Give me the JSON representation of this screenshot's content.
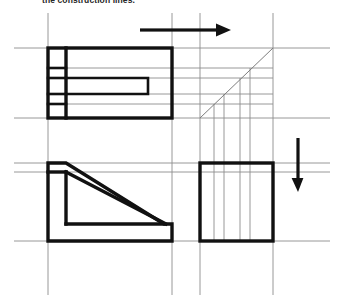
{
  "caption": {
    "text": "the construction lines."
  },
  "colors": {
    "object_line": "#111111",
    "construction_line": "#8c8c8c",
    "miter_line": "#7d7d7d",
    "arrow": "#111111",
    "background": "#ffffff",
    "caption_text": "#262626"
  },
  "drawing": {
    "type": "orthographic-projection-exercise",
    "title": "Third view projection using 45 degree miter line",
    "views": [
      {
        "name": "top-view",
        "label": "Top view",
        "shape": "rectangle-with-internal-detail",
        "x": 48,
        "y": 48,
        "width": 124,
        "height": 70,
        "internal_features": [
          {
            "name": "left-column-divider",
            "x": 66
          },
          {
            "name": "inner-slot",
            "x1": 66,
            "y1": 78,
            "x2": 148,
            "y2": 94
          }
        ]
      },
      {
        "name": "front-view",
        "label": "Front view",
        "shape": "L-shape-with-diagonal",
        "x": 48,
        "y": 163,
        "width": 124,
        "height": 78,
        "points": "48,163 66,163 66,172 164,210 164,210 164,224 66,224 66,241 172,241 172,241"
      },
      {
        "name": "side-view",
        "label": "Right side view",
        "shape": "square",
        "x": 200,
        "y": 163,
        "width": 73,
        "height": 78
      }
    ],
    "miter_line": {
      "name": "forty-five-degree-miter-line",
      "x1": 200,
      "y1": 118,
      "x2": 273,
      "y2": 48,
      "angle_degrees": 45
    },
    "arrows": [
      {
        "name": "horizontal-projection-arrow",
        "direction": "right",
        "x1": 140,
        "y1": 30,
        "x2": 228,
        "y2": 30
      },
      {
        "name": "vertical-projection-arrow",
        "direction": "down",
        "x1": 298,
        "y1": 138,
        "x2": 298,
        "y2": 190
      }
    ],
    "construction_lines": {
      "horizontal": [
        {
          "name": "h-line-top-view-top",
          "y": 48,
          "x1": 14,
          "x2": 330
        },
        {
          "name": "h-line-slot-upper",
          "y": 68,
          "x1": 48,
          "x2": 273
        },
        {
          "name": "h-line-slot-top",
          "y": 78,
          "x1": 48,
          "x2": 273
        },
        {
          "name": "h-line-slot-bottom",
          "y": 94,
          "x1": 48,
          "x2": 273
        },
        {
          "name": "h-line-slot-lower",
          "y": 104,
          "x1": 48,
          "x2": 273
        },
        {
          "name": "h-line-top-view-bottom",
          "y": 118,
          "x1": 14,
          "x2": 330
        },
        {
          "name": "h-line-front-view-top",
          "y": 163,
          "x1": 14,
          "x2": 330
        },
        {
          "name": "h-line-front-view-step",
          "y": 172,
          "x1": 14,
          "x2": 330
        },
        {
          "name": "h-line-front-view-bottom",
          "y": 241,
          "x1": 14,
          "x2": 330
        }
      ],
      "vertical": [
        {
          "name": "v-line-left-edge",
          "x": 48,
          "y1": 13,
          "y2": 295
        },
        {
          "name": "v-line-right-edge-top-view",
          "x": 172,
          "y1": 13,
          "y2": 295
        },
        {
          "name": "v-line-side-view-left",
          "x": 200,
          "y1": 13,
          "y2": 295
        },
        {
          "name": "v-line-side-view-right",
          "x": 273,
          "y1": 13,
          "y2": 295
        },
        {
          "name": "v-projector-1",
          "x": 214,
          "y1": 104,
          "y2": 241
        },
        {
          "name": "v-projector-2",
          "x": 224,
          "y1": 94,
          "y2": 241
        },
        {
          "name": "v-projector-3",
          "x": 240,
          "y1": 78,
          "y2": 241
        },
        {
          "name": "v-projector-4",
          "x": 250,
          "y1": 68,
          "y2": 241
        }
      ]
    }
  }
}
